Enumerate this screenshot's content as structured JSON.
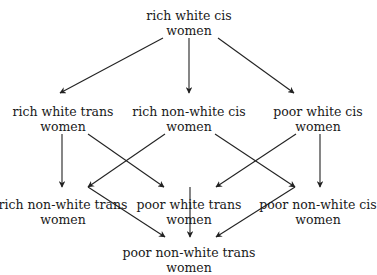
{
  "diagram": {
    "type": "hasse-lattice",
    "nodes": [
      {
        "id": "n0",
        "line1": "rich white cis",
        "line2": "women",
        "x": 189,
        "y": 8
      },
      {
        "id": "n1",
        "line1": "rich white trans",
        "line2": "women",
        "x": 63,
        "y": 104
      },
      {
        "id": "n2",
        "line1": "rich non-white cis",
        "line2": "women",
        "x": 189,
        "y": 104
      },
      {
        "id": "n3",
        "line1": "poor white cis",
        "line2": "women",
        "x": 318,
        "y": 104
      },
      {
        "id": "n4",
        "line1": "rich non-white trans",
        "line2": "women",
        "x": 63,
        "y": 197
      },
      {
        "id": "n5",
        "line1": "poor white trans",
        "line2": "women",
        "x": 189,
        "y": 197
      },
      {
        "id": "n6",
        "line1": "poor non-white cis",
        "line2": "women",
        "x": 318,
        "y": 197
      },
      {
        "id": "n7",
        "line1": "poor non-white trans",
        "line2": "women",
        "x": 189,
        "y": 245
      }
    ],
    "edges": [
      {
        "from": "n0",
        "to": "n1",
        "x1": 163,
        "y1": 38,
        "x2": 60,
        "y2": 93
      },
      {
        "from": "n0",
        "to": "n2",
        "x1": 189,
        "y1": 38,
        "x2": 189,
        "y2": 93
      },
      {
        "from": "n0",
        "to": "n3",
        "x1": 218,
        "y1": 38,
        "x2": 294,
        "y2": 93
      },
      {
        "from": "n1",
        "to": "n4",
        "x1": 62,
        "y1": 134,
        "x2": 62,
        "y2": 187
      },
      {
        "from": "n1",
        "to": "n5",
        "x1": 88,
        "y1": 134,
        "x2": 164,
        "y2": 187
      },
      {
        "from": "n2",
        "to": "n4",
        "x1": 165,
        "y1": 134,
        "x2": 88,
        "y2": 187
      },
      {
        "from": "n2",
        "to": "n6",
        "x1": 215,
        "y1": 134,
        "x2": 295,
        "y2": 187
      },
      {
        "from": "n3",
        "to": "n5",
        "x1": 296,
        "y1": 134,
        "x2": 216,
        "y2": 187
      },
      {
        "from": "n3",
        "to": "n6",
        "x1": 320,
        "y1": 134,
        "x2": 320,
        "y2": 187
      },
      {
        "from": "n4",
        "to": "n7",
        "x1": 88,
        "y1": 187,
        "x2": 165,
        "y2": 237
      },
      {
        "from": "n5",
        "to": "n7",
        "x1": 190,
        "y1": 187,
        "x2": 190,
        "y2": 237
      },
      {
        "from": "n6",
        "to": "n7",
        "x1": 295,
        "y1": 187,
        "x2": 216,
        "y2": 237
      }
    ],
    "colors": {
      "line": "#222222",
      "text": "#1a1a1a",
      "background": "#ffffff"
    }
  }
}
